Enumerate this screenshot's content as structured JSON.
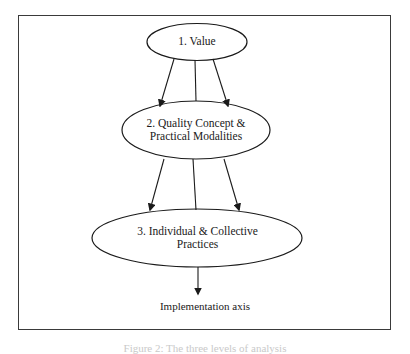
{
  "diagram": {
    "nodes": [
      {
        "id": "value",
        "lines": [
          "1. Value"
        ]
      },
      {
        "id": "quality",
        "lines": [
          "2. Quality Concept &",
          "Practical Modalities"
        ]
      },
      {
        "id": "practices",
        "lines": [
          "3. Individual & Collective",
          "Practices"
        ]
      }
    ],
    "axis_label": "Implementation axis",
    "caption": "Figure 2: The three levels of analysis",
    "colors": {
      "stroke": "#1a1a1a",
      "frame": "#3a3a3a",
      "caption": "#c9c9c9",
      "background": "#ffffff"
    }
  }
}
